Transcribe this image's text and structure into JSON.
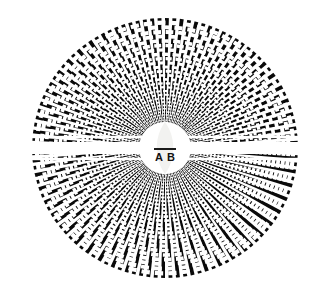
{
  "figure": {
    "background_color": "#ffffff",
    "ink_color": "#0a0a0a",
    "canvas": {
      "width": 331,
      "height": 295
    }
  },
  "disc": {
    "center_x": 165,
    "center_y": 148,
    "radius_x": 133,
    "radius_y": 130,
    "spoke_count": 112,
    "ring_count": 26,
    "inner_radius": 26,
    "description": "Black radial spokes overlaid with concentric arcs producing a moire tunnel pattern"
  },
  "bands": {
    "horizontal_gap_half_height": 6,
    "description": "Bright horizontal band crossing the disc at the vertical center"
  },
  "center_shape": {
    "name": "vesica",
    "fill_color": "#f2f2f0",
    "half_width": 11,
    "half_height": 26,
    "divider_y_offset": 1,
    "divider_color": "#1a1a1a"
  },
  "labels": {
    "left": "A",
    "right": "B",
    "left_x": 159,
    "right_x": 171,
    "y": 161,
    "font_size": 11
  },
  "icons": {
    "disc": "radial-burst-icon",
    "center": "vesica-leaf-icon"
  }
}
